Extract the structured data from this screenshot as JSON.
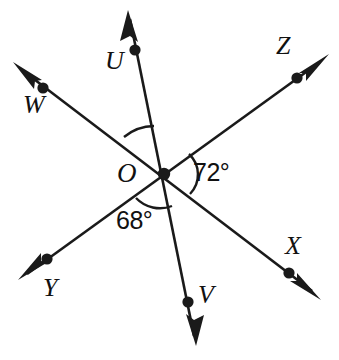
{
  "figure": {
    "kind": "angle-diagram",
    "background_color": "#ffffff",
    "stroke_color": "#1a1a1a",
    "vertex": {
      "name": "O",
      "label": "O",
      "x": 164,
      "y": 174
    },
    "rays": [
      {
        "id": "OU",
        "endpoint_label": "U",
        "dot_x": 135,
        "dot_y": 50,
        "tip_x": 128,
        "tip_y": 12,
        "direction": "up-slightly-left"
      },
      {
        "id": "OW",
        "endpoint_label": "W",
        "dot_x": 43,
        "dot_y": 88,
        "tip_x": 16,
        "tip_y": 64,
        "direction": "up-left"
      },
      {
        "id": "OZ",
        "endpoint_label": "Z",
        "dot_x": 297,
        "dot_y": 78,
        "tip_x": 326,
        "tip_y": 57,
        "direction": "up-right"
      },
      {
        "id": "OX",
        "endpoint_label": "X",
        "dot_x": 289,
        "dot_y": 273,
        "tip_x": 318,
        "tip_y": 297,
        "direction": "down-right"
      },
      {
        "id": "OY",
        "endpoint_label": "Y",
        "dot_x": 47,
        "dot_y": 259,
        "tip_x": 21,
        "tip_y": 278,
        "direction": "down-left"
      },
      {
        "id": "OV",
        "endpoint_label": "V",
        "dot_x": 188,
        "dot_y": 302,
        "tip_x": 195,
        "tip_y": 343,
        "direction": "down-slightly-right"
      }
    ],
    "lines": [
      {
        "id": "line-WX",
        "through": [
          "W",
          "O",
          "X"
        ]
      },
      {
        "id": "line-YZ",
        "through": [
          "Y",
          "O",
          "Z"
        ]
      },
      {
        "id": "line-UV",
        "through": [
          "U",
          "O",
          "V"
        ]
      }
    ],
    "angles": [
      {
        "id": "angle-WOU",
        "label": "",
        "between": [
          "W",
          "U"
        ],
        "arc_radius": 48,
        "labeled": false
      },
      {
        "id": "angle-ZOX",
        "label": "72°",
        "value": 72,
        "between": [
          "Z",
          "X"
        ],
        "arc_radius": 28,
        "labeled": true
      },
      {
        "id": "angle-VOY",
        "label": "68°",
        "value": 68,
        "between": [
          "V",
          "Y"
        ],
        "arc_radius": 33,
        "labeled": true
      }
    ],
    "point_labels": {
      "U": "U",
      "W": "W",
      "Z": "Z",
      "X": "X",
      "Y": "Y",
      "V": "V",
      "O": "O"
    }
  }
}
